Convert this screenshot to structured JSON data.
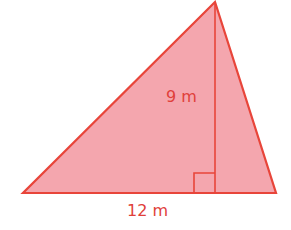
{
  "figure": {
    "shape": "triangle",
    "colors": {
      "fill": "#f4a6ae",
      "stroke": "#e8453a",
      "text": "#e0403a",
      "background": "#ffffff"
    },
    "vertices": {
      "apex": [
        215,
        2
      ],
      "bottom_left": [
        23,
        193
      ],
      "bottom_right": [
        276,
        193
      ]
    },
    "height_line": {
      "from": [
        215,
        2
      ],
      "to": [
        215,
        193
      ]
    },
    "right_angle_marker": {
      "x": 194,
      "y": 173,
      "size": 21
    },
    "labels": {
      "height": "9 m",
      "base": "12 m"
    }
  }
}
